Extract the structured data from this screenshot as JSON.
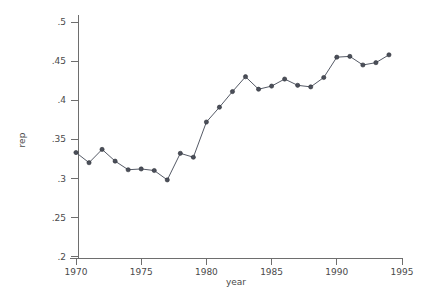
{
  "chart_data": {
    "type": "line",
    "title": "",
    "subtitle": "",
    "xlabel": "year",
    "ylabel": "rep",
    "xlim": [
      1969.0,
      1995.5
    ],
    "ylim": [
      0.1945,
      0.5055
    ],
    "grid": false,
    "legend": null,
    "marker": "circle",
    "x": [
      1970,
      1971,
      1972,
      1973,
      1974,
      1975,
      1976,
      1977,
      1978,
      1979,
      1980,
      1981,
      1982,
      1983,
      1984,
      1985,
      1986,
      1987,
      1988,
      1989,
      1990,
      1991,
      1992,
      1993,
      1994
    ],
    "values": [
      0.333,
      0.32,
      0.337,
      0.322,
      0.311,
      0.312,
      0.31,
      0.298,
      0.332,
      0.327,
      0.372,
      0.391,
      0.411,
      0.43,
      0.414,
      0.418,
      0.427,
      0.419,
      0.417,
      0.429,
      0.455,
      0.456,
      0.445,
      0.448,
      0.458
    ],
    "series": [
      {
        "name": "rep",
        "values": [
          0.333,
          0.32,
          0.337,
          0.322,
          0.311,
          0.312,
          0.31,
          0.298,
          0.332,
          0.327,
          0.372,
          0.391,
          0.411,
          0.43,
          0.414,
          0.418,
          0.427,
          0.419,
          0.417,
          0.429,
          0.455,
          0.456,
          0.445,
          0.448,
          0.458
        ]
      }
    ],
    "xticks": [
      1970,
      1975,
      1980,
      1985,
      1990,
      1995
    ],
    "xtick_labels": [
      "1970",
      "1975",
      "1980",
      "1985",
      "1990",
      "1995"
    ],
    "yticks": [
      0.2,
      0.25,
      0.3,
      0.35,
      0.4,
      0.45,
      0.5
    ],
    "ytick_labels": [
      ".2",
      ".25",
      ".3",
      ".35",
      ".4",
      ".45",
      ".5"
    ],
    "colors": {
      "line": "#555a66",
      "marker_fill": "#4b4f5a",
      "marker_edge": "#2e3138",
      "axis": "#6e6e6e",
      "text": "#4a4a4a",
      "background": "#ffffff"
    }
  }
}
